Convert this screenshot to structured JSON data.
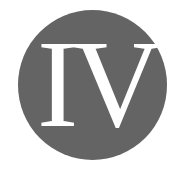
{
  "badge": {
    "numeral": "IV",
    "circle_color": "#646464",
    "text_color": "#ffffff",
    "background": "#ffffff"
  }
}
